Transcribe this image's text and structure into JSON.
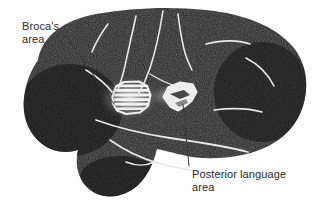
{
  "figure": {
    "width": 316,
    "height": 204,
    "background_color": "#ffffff"
  },
  "colors": {
    "background": "#ffffff",
    "brain_fill": "#1c1c1c",
    "brain_fill_dark": "#121212",
    "brain_texture": "#262626",
    "sulcus_line": "#e8e8e8",
    "highlight_bright": "#f2f2f2",
    "highlight_glow": "#9a9a9a",
    "label_text": "#2b2b2b",
    "leader_line": "#3a3a3a"
  },
  "labels": {
    "brocas": {
      "text": "Broca's\narea",
      "line1": "Broca's",
      "line2": "area"
    },
    "posterior": {
      "text": "Posterior language\narea",
      "line1": "Posterior language",
      "line2": "area"
    }
  },
  "regions": [
    {
      "id": "brocas-area",
      "name": "Broca's area",
      "style": "hatched-glowing-blob",
      "center_x": 128,
      "center_y": 99
    },
    {
      "id": "posterior-language-area",
      "name": "Posterior language area",
      "style": "bright-polygon",
      "center_x": 178,
      "center_y": 96
    }
  ],
  "anatomy": {
    "structures": [
      "frontal lobe",
      "parietal lobe",
      "occipital lobe",
      "temporal lobe",
      "central sulcus",
      "lateral (Sylvian) fissure",
      "superior temporal sulcus"
    ]
  }
}
